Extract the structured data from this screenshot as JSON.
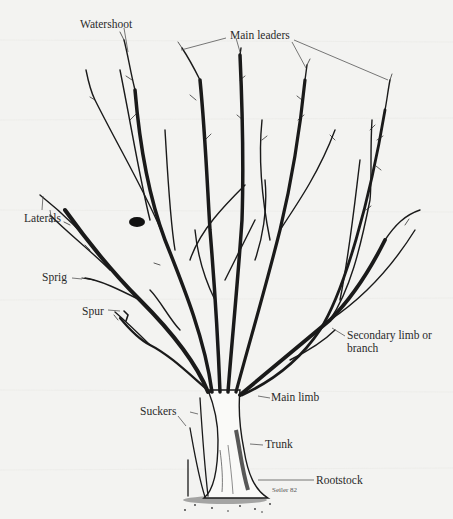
{
  "diagram": {
    "labels": {
      "watershoot": "Watershoot",
      "main_leaders": "Main leaders",
      "laterals": "Laterals",
      "sprig": "Sprig",
      "spur": "Spur",
      "secondary_limb_line1": "Secondary limb or",
      "secondary_limb_line2": "branch",
      "main_limb": "Main limb",
      "suckers": "Suckers",
      "trunk": "Trunk",
      "rootstock": "Rootstock"
    },
    "signature": "Seiler 82",
    "colors": {
      "background": "#f3f3f1",
      "ink": "#1a1a1a",
      "label_text": "#2a2a2a",
      "arrow": "#555555"
    }
  }
}
